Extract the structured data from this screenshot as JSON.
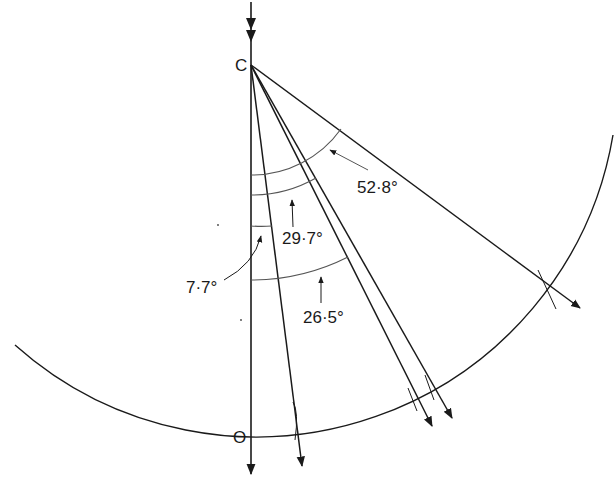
{
  "diagram": {
    "type": "refraction-ray-geometry",
    "points": {
      "center": {
        "label": "C"
      },
      "origin": {
        "label": "O"
      }
    },
    "angles": [
      {
        "label": "7·7°",
        "value": 7.7
      },
      {
        "label": "29·7°",
        "value": 29.7
      },
      {
        "label": "26·5°",
        "value": 26.5
      },
      {
        "label": "52·8°",
        "value": 52.8
      }
    ],
    "colors": {
      "line": "#1a1a1a",
      "arc": "#555555",
      "background": "#ffffff"
    }
  }
}
